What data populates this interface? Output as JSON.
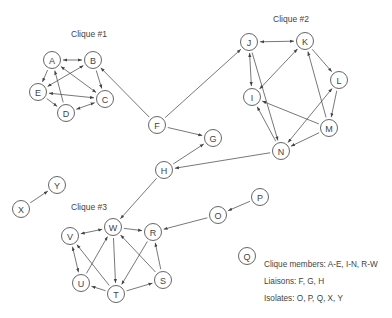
{
  "groups": [
    {
      "id": "clique1",
      "label": "Clique #1"
    },
    {
      "id": "clique2",
      "label": "Clique #2"
    },
    {
      "id": "clique3",
      "label": "Clique #3"
    }
  ],
  "nodes": [
    {
      "id": "A",
      "label": "A",
      "role": "clique member"
    },
    {
      "id": "B",
      "label": "B",
      "role": "clique member"
    },
    {
      "id": "C",
      "label": "C",
      "role": "clique member"
    },
    {
      "id": "D",
      "label": "D",
      "role": "clique member"
    },
    {
      "id": "E",
      "label": "E",
      "role": "clique member"
    },
    {
      "id": "F",
      "label": "F",
      "role": "liaison"
    },
    {
      "id": "G",
      "label": "G",
      "role": "liaison"
    },
    {
      "id": "H",
      "label": "H",
      "role": "liaison"
    },
    {
      "id": "I",
      "label": "I",
      "role": "clique member"
    },
    {
      "id": "J",
      "label": "J",
      "role": "clique member"
    },
    {
      "id": "K",
      "label": "K",
      "role": "clique member"
    },
    {
      "id": "L",
      "label": "L",
      "role": "clique member"
    },
    {
      "id": "M",
      "label": "M",
      "role": "clique member"
    },
    {
      "id": "N",
      "label": "N",
      "role": "clique member"
    },
    {
      "id": "O",
      "label": "O",
      "role": "isolate"
    },
    {
      "id": "P",
      "label": "P",
      "role": "isolate"
    },
    {
      "id": "Q",
      "label": "Q",
      "role": "isolate"
    },
    {
      "id": "R",
      "label": "R",
      "role": "clique member"
    },
    {
      "id": "S",
      "label": "S",
      "role": "clique member"
    },
    {
      "id": "T",
      "label": "T",
      "role": "clique member"
    },
    {
      "id": "U",
      "label": "U",
      "role": "clique member"
    },
    {
      "id": "V",
      "label": "V",
      "role": "clique member"
    },
    {
      "id": "W",
      "label": "W",
      "role": "clique member"
    },
    {
      "id": "X",
      "label": "X",
      "role": "isolate"
    },
    {
      "id": "Y",
      "label": "Y",
      "role": "isolate"
    }
  ],
  "edges": [
    {
      "from": "A",
      "to": "B",
      "bidirectional": true
    },
    {
      "from": "A",
      "to": "E",
      "bidirectional": false
    },
    {
      "from": "A",
      "to": "C",
      "bidirectional": true
    },
    {
      "from": "D",
      "to": "A",
      "bidirectional": false
    },
    {
      "from": "B",
      "to": "E",
      "bidirectional": true
    },
    {
      "from": "B",
      "to": "C",
      "bidirectional": false
    },
    {
      "from": "E",
      "to": "C",
      "bidirectional": true
    },
    {
      "from": "E",
      "to": "D",
      "bidirectional": false
    },
    {
      "from": "D",
      "to": "C",
      "bidirectional": true
    },
    {
      "from": "F",
      "to": "B",
      "bidirectional": false
    },
    {
      "from": "F",
      "to": "J",
      "bidirectional": false
    },
    {
      "from": "F",
      "to": "G",
      "bidirectional": false
    },
    {
      "from": "H",
      "to": "G",
      "bidirectional": false
    },
    {
      "from": "N",
      "to": "H",
      "bidirectional": false
    },
    {
      "from": "H",
      "to": "W",
      "bidirectional": false
    },
    {
      "from": "J",
      "to": "K",
      "bidirectional": true
    },
    {
      "from": "J",
      "to": "I",
      "bidirectional": true
    },
    {
      "from": "J",
      "to": "N",
      "bidirectional": false
    },
    {
      "from": "K",
      "to": "I",
      "bidirectional": true
    },
    {
      "from": "K",
      "to": "L",
      "bidirectional": false
    },
    {
      "from": "M",
      "to": "K",
      "bidirectional": false
    },
    {
      "from": "L",
      "to": "M",
      "bidirectional": false
    },
    {
      "from": "M",
      "to": "I",
      "bidirectional": false
    },
    {
      "from": "L",
      "to": "N",
      "bidirectional": true
    },
    {
      "from": "N",
      "to": "I",
      "bidirectional": false
    },
    {
      "from": "M",
      "to": "N",
      "bidirectional": false
    },
    {
      "from": "V",
      "to": "W",
      "bidirectional": true
    },
    {
      "from": "W",
      "to": "R",
      "bidirectional": false
    },
    {
      "from": "W",
      "to": "T",
      "bidirectional": false
    },
    {
      "from": "V",
      "to": "U",
      "bidirectional": true
    },
    {
      "from": "U",
      "to": "W",
      "bidirectional": false
    },
    {
      "from": "T",
      "to": "V",
      "bidirectional": false
    },
    {
      "from": "R",
      "to": "T",
      "bidirectional": false
    },
    {
      "from": "S",
      "to": "W",
      "bidirectional": false
    },
    {
      "from": "S",
      "to": "R",
      "bidirectional": false
    },
    {
      "from": "T",
      "to": "U",
      "bidirectional": false
    },
    {
      "from": "T",
      "to": "S",
      "bidirectional": false
    },
    {
      "from": "O",
      "to": "R",
      "bidirectional": false
    },
    {
      "from": "P",
      "to": "O",
      "bidirectional": false
    },
    {
      "from": "X",
      "to": "Y",
      "bidirectional": false
    }
  ],
  "legend": {
    "clique_members": "Clique members: A-E, I-N, R-W",
    "liaisons": "Liaisons: F, G, H",
    "isolates": "Isolates: O, P, Q, X, Y"
  }
}
